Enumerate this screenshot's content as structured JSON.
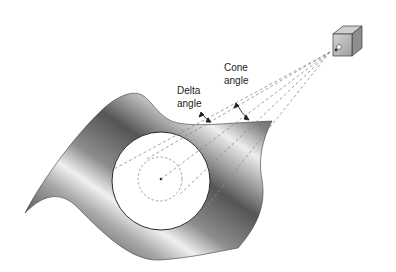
{
  "diagram": {
    "labels": {
      "cone_line1": "Cone",
      "cone_line2": "angle",
      "delta_line1": "Delta",
      "delta_line2": "angle"
    },
    "colors": {
      "sheet_dark": "#5a5a5a",
      "sheet_mid": "#9a9a9a",
      "sheet_light": "#e8e8e8",
      "dashed": "#8a8a8a",
      "spot": "#ffffff",
      "source_box": "#b8b8b8"
    },
    "components": [
      "light-source",
      "cone-beam",
      "curved-sheet",
      "illuminated-spot",
      "delta-spot"
    ]
  }
}
